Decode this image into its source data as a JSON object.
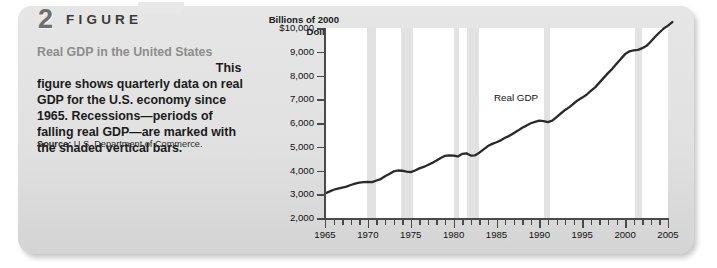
{
  "figure": {
    "number": "2",
    "word": "FIGURE",
    "title": "Real GDP in the United States",
    "body": "This figure shows quarterly data on real GDP for the U.S. economy since 1965. Recessions—periods of falling real GDP—are marked with the shaded vertical bars.",
    "source_label": "Source:",
    "source_text": "U.S. Department of Commerce."
  },
  "chart_data": {
    "type": "line",
    "title": "",
    "axis_title": "Billions of 2000 Dollars",
    "xlabel": "",
    "ylabel": "Billions of 2000 Dollars",
    "xlim": [
      1965,
      2005
    ],
    "ylim": [
      2000,
      10000
    ],
    "ytick_labels": [
      "$10,000",
      "9,000",
      "8,000",
      "7,000",
      "6,000",
      "5,000",
      "4,000",
      "3,000",
      "2,000"
    ],
    "ytick_values": [
      10000,
      9000,
      8000,
      7000,
      6000,
      5000,
      4000,
      3000,
      2000
    ],
    "xtick_labels": [
      "1965",
      "1970",
      "1975",
      "1980",
      "1985",
      "1990",
      "1995",
      "2000",
      "2005"
    ],
    "xtick_values": [
      1965,
      1970,
      1975,
      1980,
      1985,
      1990,
      1995,
      2000,
      2005
    ],
    "xtick_minor_step": 1,
    "grid": false,
    "legend_position": "inline-annotation",
    "series": [
      {
        "name": "Real GDP",
        "annotation": "Real GDP",
        "color": "#2a2a2a",
        "x": [
          1965,
          1965.5,
          1966,
          1966.5,
          1967,
          1967.5,
          1968,
          1968.5,
          1969,
          1969.5,
          1970,
          1970.5,
          1971,
          1971.5,
          1972,
          1972.5,
          1973,
          1973.5,
          1974,
          1974.5,
          1975,
          1975.5,
          1976,
          1976.5,
          1977,
          1977.5,
          1978,
          1978.5,
          1979,
          1979.5,
          1980,
          1980.5,
          1981,
          1981.5,
          1982,
          1982.5,
          1983,
          1983.5,
          1984,
          1984.5,
          1985,
          1985.5,
          1986,
          1986.5,
          1987,
          1987.5,
          1988,
          1988.5,
          1989,
          1989.5,
          1990,
          1990.5,
          1991,
          1991.5,
          1992,
          1992.5,
          1993,
          1993.5,
          1994,
          1994.5,
          1995,
          1995.5,
          1996,
          1996.5,
          1997,
          1997.5,
          1998,
          1998.5,
          1999,
          1999.5,
          2000,
          2000.5,
          2001,
          2001.5,
          2002,
          2002.5,
          2003,
          2003.5,
          2004,
          2004.5,
          2005,
          2005.5
        ],
        "y": [
          3029,
          3110,
          3190,
          3240,
          3283,
          3320,
          3390,
          3450,
          3490,
          3510,
          3520,
          3510,
          3580,
          3640,
          3760,
          3850,
          3960,
          4000,
          3990,
          3950,
          3930,
          4000,
          4090,
          4150,
          4230,
          4320,
          4420,
          4530,
          4620,
          4640,
          4630,
          4590,
          4700,
          4720,
          4630,
          4640,
          4750,
          4890,
          5030,
          5120,
          5190,
          5270,
          5380,
          5460,
          5570,
          5680,
          5800,
          5890,
          5990,
          6050,
          6100,
          6080,
          6040,
          6100,
          6250,
          6400,
          6550,
          6670,
          6820,
          6960,
          7070,
          7190,
          7350,
          7500,
          7700,
          7900,
          8100,
          8280,
          8490,
          8700,
          8900,
          9020,
          9060,
          9080,
          9150,
          9250,
          9430,
          9630,
          9810,
          9980,
          10100,
          10250
        ]
      }
    ],
    "recessions": [
      {
        "start": 1969.92,
        "end": 1970.92
      },
      {
        "start": 1973.92,
        "end": 1975.25
      },
      {
        "start": 1980.08,
        "end": 1980.58
      },
      {
        "start": 1981.58,
        "end": 1982.92
      },
      {
        "start": 1990.58,
        "end": 1991.25
      },
      {
        "start": 2001.17,
        "end": 2001.92
      }
    ],
    "recession_color": "#e2e2e2"
  }
}
